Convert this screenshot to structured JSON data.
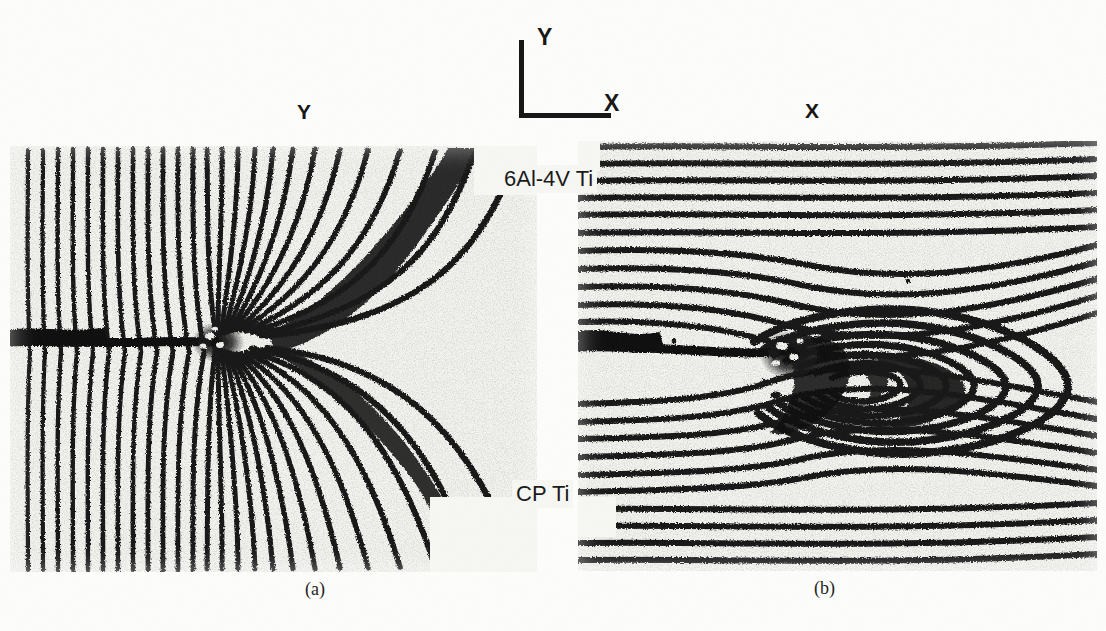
{
  "figure": {
    "kind": "moire-interferometry-fringe-photographs",
    "axis_key": {
      "name": "coordinate-axes-key",
      "y_label": "Y",
      "x_label": "X"
    },
    "panels": [
      {
        "id": "a",
        "caption": "(a)",
        "field_letter": "Y",
        "fringe_pattern": "butterfly",
        "description": "Y displacement field moire fringe pattern at crack tip"
      },
      {
        "id": "b",
        "caption": "(b)",
        "field_letter": "X",
        "fringe_pattern": "concentric-loops",
        "description": "X displacement field moire fringe pattern at crack tip"
      }
    ],
    "specimen_labels": {
      "top": "6Al-4V Ti",
      "bottom": "CP Ti"
    },
    "cut_off_text": {
      "top": "",
      "bottom": ""
    },
    "colors": {
      "ink": "#141414",
      "paper": "#fdfdfb",
      "panel_paper": "#f2f2ee"
    }
  }
}
